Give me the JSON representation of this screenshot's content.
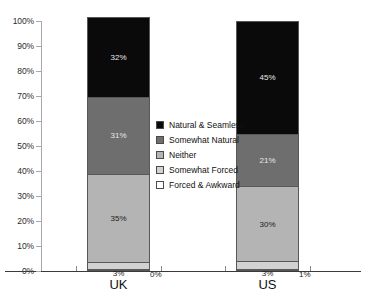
{
  "chart_data": {
    "type": "bar",
    "subtype": "stacked-percentage",
    "title": "",
    "xlabel": "",
    "ylabel": "",
    "ylim": [
      0,
      100
    ],
    "grid": false,
    "legend_position": "inside-center",
    "categories": [
      "UK",
      "US"
    ],
    "y_ticks": [
      "0%",
      "10%",
      "20%",
      "30%",
      "40%",
      "50%",
      "60%",
      "70%",
      "80%",
      "90%",
      "100%"
    ],
    "y_tick_values": [
      0,
      10,
      20,
      30,
      40,
      50,
      60,
      70,
      80,
      90,
      100
    ],
    "series": [
      {
        "name": "Forced & Awkward",
        "color": "#ffffff",
        "values": [
          0,
          1
        ],
        "labels": [
          "0%",
          "1%"
        ]
      },
      {
        "name": "Somewhat Forced",
        "color": "#d2d2d2",
        "values": [
          3,
          3
        ],
        "labels": [
          "3%",
          "3%"
        ]
      },
      {
        "name": "Neither",
        "color": "#b4b4b4",
        "values": [
          35,
          30
        ],
        "labels": [
          "35%",
          "30%"
        ]
      },
      {
        "name": "Somewhat Natural",
        "color": "#6e6e6e",
        "values": [
          31,
          21
        ],
        "labels": [
          "31%",
          "21%"
        ]
      },
      {
        "name": "Natural & Seamless",
        "color": "#0a0a0a",
        "values": [
          32,
          45
        ],
        "labels": [
          "32%",
          "45%"
        ]
      }
    ],
    "legend_entries": [
      "Natural & Seamless",
      "Somewhat Natural",
      "Neither",
      "Somewhat Forced",
      "Forced & Awkward"
    ],
    "legend_colors": [
      "#0a0a0a",
      "#6e6e6e",
      "#b4b4b4",
      "#d2d2d2",
      "#ffffff"
    ]
  }
}
